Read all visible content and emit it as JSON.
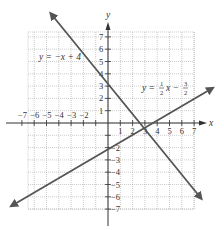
{
  "chart_data": {
    "type": "line",
    "title": "",
    "xlabel": "x",
    "ylabel": "y",
    "xlim": [
      -7,
      7
    ],
    "ylim": [
      -7,
      7
    ],
    "grid": true,
    "x_ticks": [
      "-7",
      "-6",
      "-5",
      "-4",
      "-3",
      "-2",
      "1",
      "2",
      "3",
      "4",
      "5",
      "6",
      "7"
    ],
    "y_ticks": [
      "7",
      "6",
      "5",
      "4",
      "3",
      "2",
      "1",
      "-2",
      "-3",
      "-4",
      "-5",
      "-6",
      "-7"
    ],
    "series": [
      {
        "name": "y = -x + 4",
        "equation": "y=-x+4",
        "slope": -1,
        "intercept": 4,
        "points": [
          [
            -4.5,
            8.5
          ],
          [
            7.5,
            -3.5
          ]
        ]
      },
      {
        "name": "y = 1/2 x - 3/2",
        "equation": "y=(1/2)x-(3/2)",
        "slope": 0.5,
        "intercept": -1.5,
        "points": [
          [
            -7.8,
            -5.4
          ],
          [
            8.2,
            2.6
          ]
        ]
      }
    ],
    "annotations": [
      {
        "text": "y = −x + 4",
        "near": [
          -5,
          4.5
        ]
      },
      {
        "text": "y = ½x − ³⁄₂",
        "near": [
          3.5,
          2
        ]
      }
    ],
    "intersection": [
      3.67,
      0.33
    ]
  },
  "labels": {
    "x_axis": "x",
    "y_axis": "y",
    "line1_label": "y = −x + 4",
    "line2_label_prefix": "y =",
    "line2_frac1_num": "1",
    "line2_frac1_den": "2",
    "line2_mid": "x −",
    "line2_frac2_num": "3",
    "line2_frac2_den": "2"
  }
}
